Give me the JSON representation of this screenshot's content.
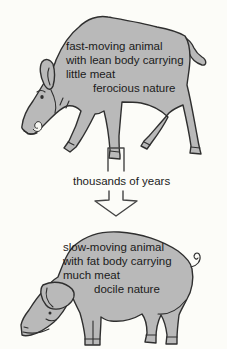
{
  "palette": {
    "background": "#fcfcf8",
    "animal_fill": "#b9b9b9",
    "animal_outline": "#2f2f2f",
    "arrow_outline": "#454545",
    "tusk_fill": "#f7f7f2",
    "text": "#1b1b1b"
  },
  "before": {
    "illustration": "wild-boar",
    "label_lines": [
      "fast-moving animal",
      "with lean body carrying",
      "little meat",
      "ferocious nature"
    ]
  },
  "transition": {
    "illustration": "down-arrow",
    "label": "thousands of years"
  },
  "after": {
    "illustration": "domestic-pig",
    "label_lines": [
      "slow-moving animal",
      "with fat body carrying",
      "much meat",
      "docile nature"
    ]
  }
}
